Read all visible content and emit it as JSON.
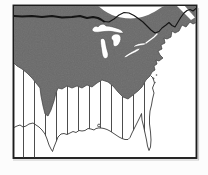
{
  "figure": {
    "kind": "printed-map-figure",
    "colors": {
      "page_background": "#fcfcfc",
      "frame_stroke": "#1c1c1c",
      "frame_shadow": "#c7c7c7",
      "map_water_fill": "#ffffff",
      "glacial_region_fill": "#6a6a6a",
      "glacial_region_edge": "#3d3d3d",
      "hatch_line_stroke": "#4d4d4d",
      "coastline_stroke": "#3a3a3a",
      "border_line_stroke": "#141414",
      "lake_fill": "#ffffff",
      "lake_outline": "#474747",
      "island_fill": "#555555"
    },
    "regions": [
      "shaded-glaciated-area",
      "vertical-hatched-coastal-plain",
      "great-lakes",
      "hudson-bay",
      "st-lawrence-estuary",
      "atlantic-ocean",
      "gulf-of-mexico",
      "florida-peninsula"
    ]
  }
}
